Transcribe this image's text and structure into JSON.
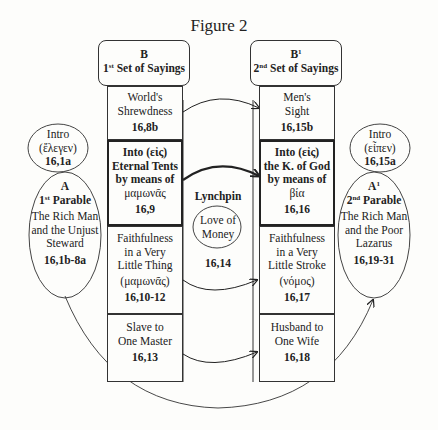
{
  "figure_title": "Figure 2",
  "left_header": {
    "letter": "B",
    "ordinal": "1",
    "ordinal_sup": "st",
    "label": " Set of Sayings"
  },
  "right_header": {
    "letter": "B",
    "letter_sup": "1",
    "ordinal": "2",
    "ordinal_sup": "nd",
    "label": " Set of Sayings"
  },
  "left_column": [
    {
      "lines": [
        "World's",
        "Shrewdness"
      ],
      "ref": "16,8b"
    },
    {
      "lines": [
        "Into (εἰς)",
        "Eternal Tents",
        "by means of",
        "μαμωνᾶς"
      ],
      "ref": "16,9"
    },
    {
      "lines": [
        "Faithfulness",
        "in a Very",
        "Little Thing",
        "(μαμωνᾶς)"
      ],
      "ref": "16,10-12"
    },
    {
      "lines": [
        "Slave to",
        "One Master"
      ],
      "ref": "16,13"
    }
  ],
  "right_column": [
    {
      "lines": [
        "Men's",
        "Sight"
      ],
      "ref": "16,15b"
    },
    {
      "lines": [
        "Into (εἰς)",
        "the K. of God",
        "by means of",
        "βία"
      ],
      "ref": "16,16"
    },
    {
      "lines": [
        "Faithfulness",
        "in a Very",
        "Little Stroke",
        "(νόμος)"
      ],
      "ref": "16,17"
    },
    {
      "lines": [
        "Husband to",
        "One Wife"
      ],
      "ref": "16,18"
    }
  ],
  "lynchpin": {
    "title": "Lynchpin",
    "oval_lines": [
      "Love of",
      "Money"
    ],
    "ref": "16,14"
  },
  "left_intro": {
    "lines": [
      "Intro",
      "(ἔλεγεν)"
    ],
    "ref": "16,1a"
  },
  "right_intro": {
    "lines": [
      "Intro",
      "(εἶπεν)"
    ],
    "ref": "16,15a"
  },
  "left_parable": {
    "letter": "A",
    "ordinal": "1",
    "ordinal_sup": "st",
    "label": " Parable",
    "lines": [
      "The Rich Man",
      "and the Unjust",
      "Steward"
    ],
    "ref": "16,1b-8a"
  },
  "right_parable": {
    "letter": "A",
    "letter_sup": "1",
    "ordinal": "2",
    "ordinal_sup": "nd",
    "label": " Parable",
    "lines": [
      "The Rich Man",
      "and the Poor",
      "Lazarus"
    ],
    "ref": "16,19-31"
  }
}
